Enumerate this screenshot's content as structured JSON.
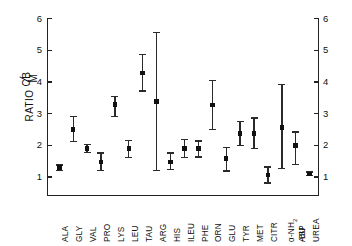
{
  "chart_data": {
    "type": "scatter",
    "title": "",
    "subtitle": "",
    "xlabel": "",
    "ylabel": "RATIO CB/M",
    "ylabel_parts": {
      "prefix": "RATIO ",
      "numerator": "CB",
      "denominator": "M"
    },
    "ylim": [
      0.35,
      6.0
    ],
    "y_ticks": [
      1,
      2,
      3,
      4,
      5,
      6
    ],
    "y_ticks_right": [
      1,
      2,
      3,
      4,
      5,
      6
    ],
    "grid": false,
    "legend": "none",
    "error_bar_style": "capped-vertical",
    "marker_style": "filled-square",
    "categories": [
      "ALA",
      "GLY",
      "VAL",
      "PRO",
      "LYS",
      "LEU",
      "TAU",
      "ARG",
      "HIS",
      "ILEU",
      "PHE",
      "ORN",
      "GLU",
      "TYR",
      "MET",
      "CITR",
      "α-NH₂-BU",
      "ASP",
      "UREA"
    ],
    "category_labels_multiline": {
      "α-NH₂-BU": [
        "α-NH₂",
        "-BU"
      ]
    },
    "values": [
      1.3,
      2.5,
      1.9,
      1.48,
      3.28,
      1.9,
      4.28,
      3.38,
      1.48,
      1.9,
      1.9,
      3.27,
      1.58,
      2.38,
      2.38,
      1.07,
      2.57,
      2.0,
      1.1
    ],
    "err_low": [
      1.2,
      2.12,
      1.76,
      1.2,
      2.9,
      1.6,
      3.7,
      1.2,
      1.22,
      1.6,
      1.62,
      2.48,
      1.18,
      1.98,
      1.88,
      0.8,
      1.27,
      1.38,
      1.04
    ],
    "err_high": [
      1.4,
      2.92,
      2.04,
      1.78,
      3.56,
      2.18,
      4.88,
      5.58,
      1.78,
      2.2,
      2.16,
      4.06,
      1.96,
      2.78,
      2.88,
      1.34,
      3.93,
      2.44,
      1.18
    ],
    "series": [
      {
        "name": "CB/M ratio",
        "points": [
          {
            "category": "ALA",
            "value": 1.3,
            "low": 1.2,
            "high": 1.4
          },
          {
            "category": "GLY",
            "value": 2.5,
            "low": 2.12,
            "high": 2.92
          },
          {
            "category": "VAL",
            "value": 1.9,
            "low": 1.76,
            "high": 2.04
          },
          {
            "category": "PRO",
            "value": 1.48,
            "low": 1.2,
            "high": 1.78
          },
          {
            "category": "LYS",
            "value": 3.28,
            "low": 2.9,
            "high": 3.56
          },
          {
            "category": "LEU",
            "value": 1.9,
            "low": 1.6,
            "high": 2.18
          },
          {
            "category": "TAU",
            "value": 4.28,
            "low": 3.7,
            "high": 4.88
          },
          {
            "category": "ARG",
            "value": 3.38,
            "low": 1.2,
            "high": 5.58
          },
          {
            "category": "HIS",
            "value": 1.48,
            "low": 1.22,
            "high": 1.78
          },
          {
            "category": "ILEU",
            "value": 1.9,
            "low": 1.6,
            "high": 2.2
          },
          {
            "category": "PHE",
            "value": 1.9,
            "low": 1.62,
            "high": 2.16
          },
          {
            "category": "ORN",
            "value": 3.27,
            "low": 2.48,
            "high": 4.06
          },
          {
            "category": "GLU",
            "value": 1.58,
            "low": 1.18,
            "high": 1.96
          },
          {
            "category": "TYR",
            "value": 2.38,
            "low": 1.98,
            "high": 2.78
          },
          {
            "category": "MET",
            "value": 2.38,
            "low": 1.88,
            "high": 2.88
          },
          {
            "category": "CITR",
            "value": 1.07,
            "low": 0.8,
            "high": 1.34
          },
          {
            "category": "α-NH₂-BU",
            "value": 2.57,
            "low": 1.27,
            "high": 3.93
          },
          {
            "category": "ASP",
            "value": 2.0,
            "low": 1.38,
            "high": 2.44
          },
          {
            "category": "UREA",
            "value": 1.1,
            "low": 1.04,
            "high": 1.18
          }
        ]
      }
    ],
    "colors": {
      "marker": "#111111",
      "errorbar": "#2a2a2a",
      "axis": "#222222",
      "background": "#ffffff"
    }
  }
}
